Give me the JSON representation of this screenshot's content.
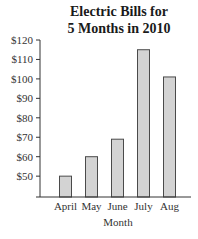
{
  "chart_data": {
    "type": "bar",
    "title": "Electric Bills for 5 Months in 2010",
    "title_lines": [
      "Electric Bills for",
      "5 Months in 2010"
    ],
    "xlabel": "Month",
    "ylabel": "",
    "categories": [
      "April",
      "May",
      "June",
      "July",
      "Aug"
    ],
    "values": [
      50,
      60,
      69,
      115,
      101
    ],
    "y_ticks": [
      "$50",
      "$60",
      "$70",
      "$80",
      "$90",
      "$100",
      "$110",
      "$120"
    ],
    "y_tick_values": [
      50,
      60,
      70,
      80,
      90,
      100,
      110,
      120
    ],
    "ylim": [
      40,
      120
    ],
    "grid": false,
    "legend": null,
    "colors": {
      "bar_fill": "#d3d3d3",
      "bar_stroke": "#4a4a4a",
      "axis": "#333333"
    }
  }
}
